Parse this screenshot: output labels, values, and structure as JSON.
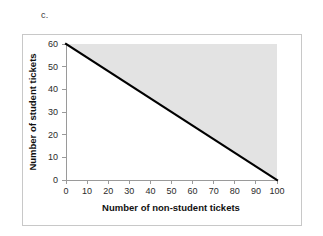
{
  "figure": {
    "part_label": "c."
  },
  "chart_data": {
    "type": "line",
    "title": "",
    "xlabel": "Number of non-student tickets",
    "ylabel": "Number of student tickets",
    "xlim": [
      0,
      100
    ],
    "ylim": [
      0,
      60
    ],
    "xticks": [
      0,
      10,
      20,
      30,
      40,
      50,
      60,
      70,
      80,
      90,
      100
    ],
    "yticks": [
      0,
      10,
      20,
      30,
      40,
      50,
      60
    ],
    "xtick_labels": [
      "0",
      "10",
      "20",
      "30",
      "40",
      "50",
      "60",
      "70",
      "80",
      "90",
      "100"
    ],
    "ytick_labels": [
      "0",
      "10",
      "20",
      "30",
      "40",
      "50",
      "60"
    ],
    "grid": false,
    "legend": null,
    "series": [
      {
        "name": "boundary-line",
        "x": [
          0,
          100
        ],
        "values": [
          60,
          0
        ],
        "color": "#000000",
        "linewidth": 2.1
      }
    ],
    "shaded_region": {
      "name": "feasible-region-above-line",
      "color": "#e3e3e3",
      "vertices_x": [
        0,
        100,
        100,
        0
      ],
      "vertices_y": [
        60,
        0,
        60,
        60
      ],
      "description": "Light gray shading above the line from (0,60) to (100,0), bounded by y=60 and x=100"
    },
    "annotations": []
  },
  "colors": {
    "frame_border": "#c8c8c8",
    "axis": "#9a9a9a",
    "line": "#000000",
    "shading": "#e3e3e3",
    "text": "#1a1a1a",
    "background": "#ffffff"
  }
}
